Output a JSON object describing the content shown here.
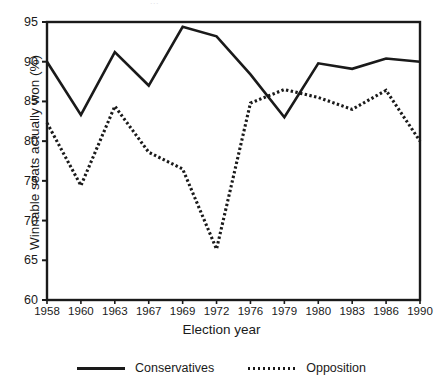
{
  "top_artifact_text": "...",
  "axes": {
    "ylabel": "Winnable seats actually won (%)",
    "xlabel": "Election year",
    "yticks": [
      "60",
      "65",
      "70",
      "75",
      "80",
      "85",
      "90",
      "95"
    ],
    "xticks": [
      "1958",
      "1960",
      "1963",
      "1967",
      "1969",
      "1972",
      "1976",
      "1979",
      "1980",
      "1983",
      "1986",
      "1990"
    ]
  },
  "legend": {
    "entries": [
      {
        "label": "Conservatives",
        "style": "solid",
        "color": "#1a1a1a"
      },
      {
        "label": "Opposition",
        "style": "dotted",
        "color": "#1a1a1a"
      }
    ]
  },
  "chart_data": {
    "type": "line",
    "title": "",
    "subtitle": "",
    "xlabel": "Election year",
    "ylabel": "Winnable seats actually won (%)",
    "categories": [
      "1958",
      "1960",
      "1963",
      "1967",
      "1969",
      "1972",
      "1976",
      "1979",
      "1980",
      "1983",
      "1986",
      "1990"
    ],
    "x": [
      1958,
      1960,
      1963,
      1967,
      1969,
      1972,
      1976,
      1979,
      1980,
      1983,
      1986,
      1990
    ],
    "ylim": [
      60,
      95
    ],
    "yticks": [
      60,
      65,
      70,
      75,
      80,
      85,
      90,
      95
    ],
    "grid": false,
    "legend_position": "bottom",
    "series": [
      {
        "name": "Conservatives",
        "style": "solid",
        "color": "#1a1a1a",
        "values": [
          90.0,
          83.3,
          91.2,
          87.0,
          94.4,
          93.2,
          88.4,
          83.0,
          89.8,
          89.1,
          90.4,
          90.0
        ]
      },
      {
        "name": "Opposition",
        "style": "dotted",
        "color": "#1a1a1a",
        "values": [
          82.3,
          74.4,
          84.4,
          78.6,
          76.5,
          66.4,
          84.8,
          86.5,
          85.5,
          84.0,
          86.4,
          80.0
        ]
      }
    ]
  }
}
